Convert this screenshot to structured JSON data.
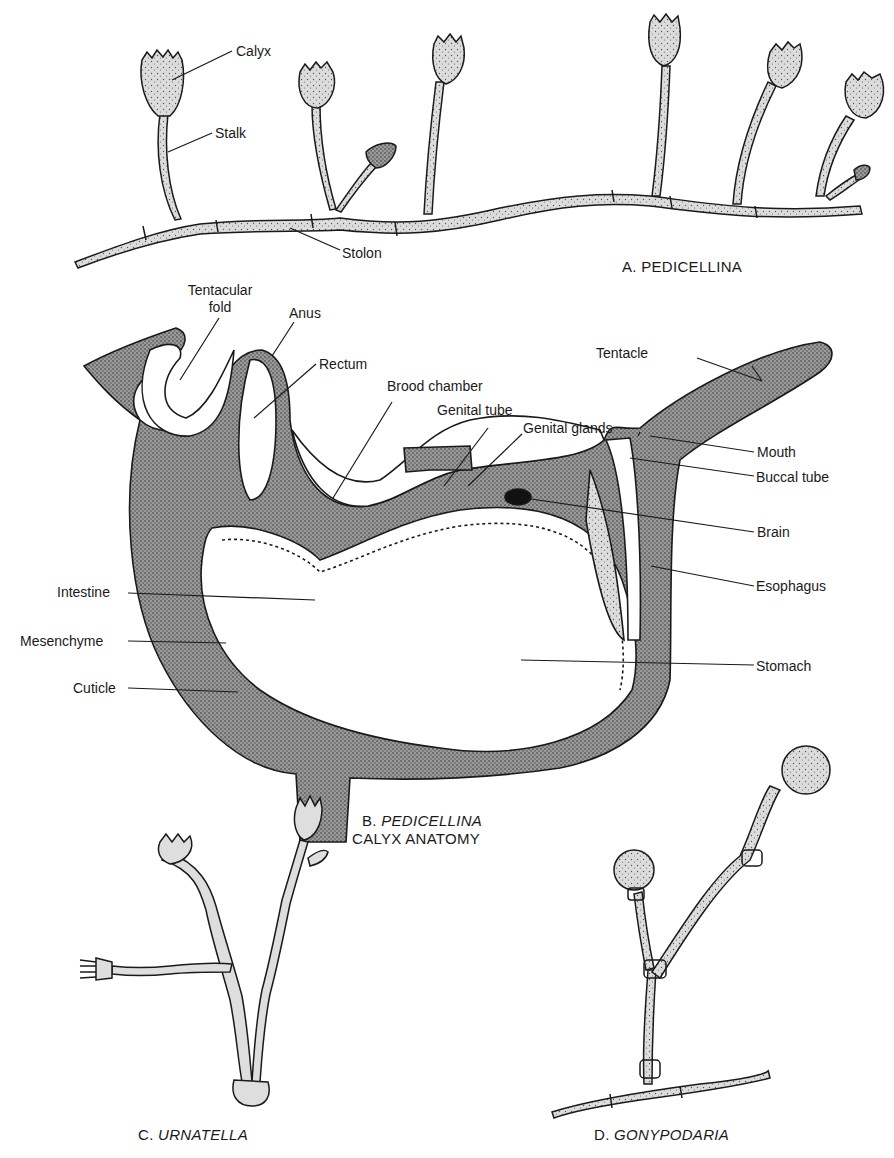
{
  "figure": {
    "panels": [
      {
        "id": "A",
        "caption": "A. PEDICELLINA",
        "labels": [
          "Calyx",
          "Stalk",
          "Stolon"
        ]
      },
      {
        "id": "B",
        "caption_prefix": "B.",
        "caption_italic": "PEDICELLINA",
        "caption_line2": "CALYX ANATOMY",
        "labels": {
          "tentacular_fold_1": "Tentacular",
          "tentacular_fold_2": "fold",
          "anus": "Anus",
          "rectum": "Rectum",
          "brood_chamber": "Brood chamber",
          "genital_tube": "Genital tube",
          "genital_glands": "Genital glands",
          "tentacle": "Tentacle",
          "mouth": "Mouth",
          "buccal_tube": "Buccal tube",
          "brain": "Brain",
          "esophagus": "Esophagus",
          "intestine": "Intestine",
          "mesenchyme": "Mesenchyme",
          "cuticle": "Cuticle",
          "stomach": "Stomach"
        }
      },
      {
        "id": "C",
        "caption_prefix": "C.",
        "caption_italic": "URNATELLA"
      },
      {
        "id": "D",
        "caption_prefix": "D.",
        "caption_italic": "GONYPODARIA"
      }
    ],
    "colors": {
      "ink": "#1a1a1a",
      "tissue_light": "#d9d9d9",
      "tissue_dark": "#8c8c8c",
      "background": "#ffffff"
    }
  }
}
